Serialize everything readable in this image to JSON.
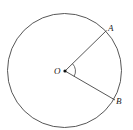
{
  "diagram": {
    "type": "circle-with-central-angle",
    "center": {
      "label": "O"
    },
    "points": [
      {
        "label": "A"
      },
      {
        "label": "B"
      }
    ],
    "segments": [
      "OA",
      "OB"
    ],
    "angle": {
      "name": "AOB",
      "marked": true
    },
    "colors": {
      "stroke": "#333333",
      "background": "#ffffff"
    }
  }
}
